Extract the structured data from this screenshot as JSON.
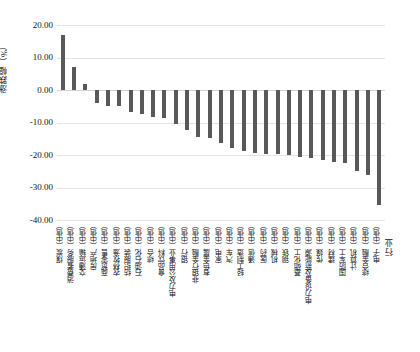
{
  "chart_data": {
    "type": "bar",
    "title": "",
    "subtitle": "",
    "xlabel": "行业",
    "ylabel": "涨跌幅（%）",
    "ylim": [
      -40,
      20
    ],
    "yticks": [
      "20.00",
      "10.00",
      "0.00",
      "-10.00",
      "-20.00",
      "-30.00",
      "-40.00"
    ],
    "ytick_values": [
      20,
      10,
      0,
      -10,
      -20,
      -30,
      -40
    ],
    "grid": true,
    "legend": "none",
    "bar_color": "#595959",
    "categories": [
      "煤炭（中信）",
      "消费者服务（中信）",
      "交通运输（中信）",
      "房地产（中信）",
      "商贸零售（中信）",
      "农林牧渔（中信）",
      "纺织服装（中信）",
      "石油石化（中信）",
      "综合（中信）",
      "食品饮料（中信）",
      "电力及公用事业（中信）",
      "银行（中信）",
      "非银行金融（中信）",
      "有色金属（中信）",
      "家电（中信）",
      "汽车（中信）",
      "轻工制造（中信）",
      "通信（中信）",
      "医药（中信）",
      "机械（中信）",
      "钢铁（中信）",
      "基础化工（中信）",
      "电力设备及新能源（中信）",
      "传媒（中信）",
      "建材（中信）",
      "国防军工（中信）",
      "计算机（中信）",
      "综合金融（中信）",
      "电子（中信）"
    ],
    "values": [
      17.0,
      7.1,
      1.9,
      -3.9,
      -5.0,
      -5.0,
      -6.8,
      -7.5,
      -8.3,
      -8.6,
      -10.5,
      -12.3,
      -14.6,
      -14.7,
      -16.3,
      -17.9,
      -18.8,
      -19.3,
      -19.6,
      -19.8,
      -20.1,
      -20.6,
      -21.0,
      -21.4,
      -22.0,
      -22.4,
      -24.8,
      -26.2,
      -35.4
    ]
  }
}
